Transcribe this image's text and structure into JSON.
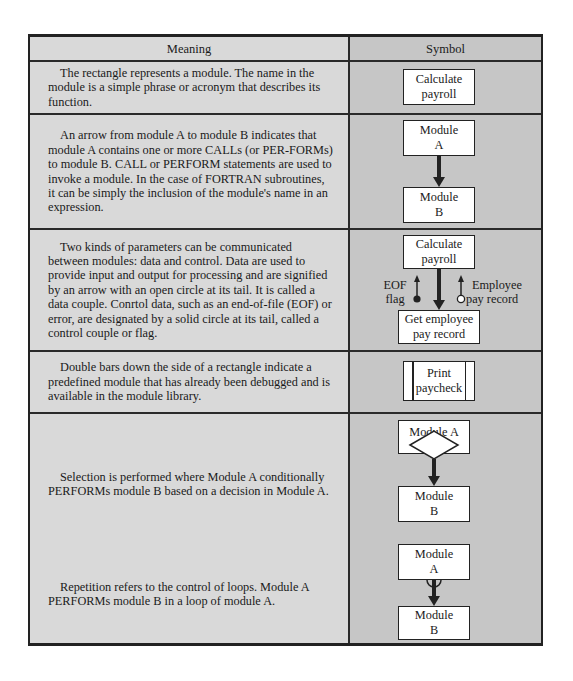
{
  "table": {
    "headers": {
      "meaning": "Meaning",
      "symbol": "Symbol"
    },
    "colors": {
      "meaning_bg": "#d9d9d9",
      "symbol_bg": "#c6c6c6",
      "box_bg": "#ffffff",
      "line": "#222222"
    },
    "rows": [
      {
        "meaning": "The rectangle represents a module. The name in the module is a simple phrase or acronym that describes its function.",
        "symbol": {
          "type": "module",
          "box_line1": "Calculate",
          "box_line2": "payroll"
        }
      },
      {
        "meaning": "An arrow from module A to module B indicates that module A contains one or more CALLs (or PER-FORMs) to module B. CALL or PERFORM statements are used to invoke a module. In the case of FORTRAN subroutines, it can be simply the inclusion of the module's name in an expression.",
        "symbol": {
          "type": "call-arrow",
          "top_line1": "Module",
          "top_line2": "A",
          "bottom_line1": "Module",
          "bottom_line2": "B"
        }
      },
      {
        "meaning": "Two kinds of parameters can be communicated between modules: data and control. Data are used to provide input and output for processing and are signified by an arrow with an open circle at its tail. It is called a data couple. Conrtol data, such as an end-of-file (EOF) or error, are designated by a solid circle at its tail, called a control couple or flag.",
        "symbol": {
          "type": "couples",
          "top_line1": "Calculate",
          "top_line2": "payroll",
          "bottom_line1": "Get employee",
          "bottom_line2": "pay record",
          "flag_label_line1": "EOF",
          "flag_label_line2": "flag",
          "data_label_line1": "Employee",
          "data_label_line2": "pay record"
        }
      },
      {
        "meaning": "Double bars down the side of a rectangle indicate a predefined module that has already been debugged and is available in the module library.",
        "symbol": {
          "type": "predefined-module",
          "box_line1": "Print",
          "box_line2": "paycheck"
        }
      },
      {
        "meaning": "Selection is performed where Module A conditionally PERFORMs module B based on a decision in Module A.",
        "symbol": {
          "type": "selection",
          "top_label": "Module A",
          "bottom_line1": "Module",
          "bottom_line2": "B"
        }
      },
      {
        "meaning": "Repetition refers to the control of loops. Module A PERFORMs module B in a loop of module A.",
        "symbol": {
          "type": "repetition",
          "top_line1": "Module",
          "top_line2": "A",
          "bottom_line1": "Module",
          "bottom_line2": "B"
        }
      }
    ]
  }
}
